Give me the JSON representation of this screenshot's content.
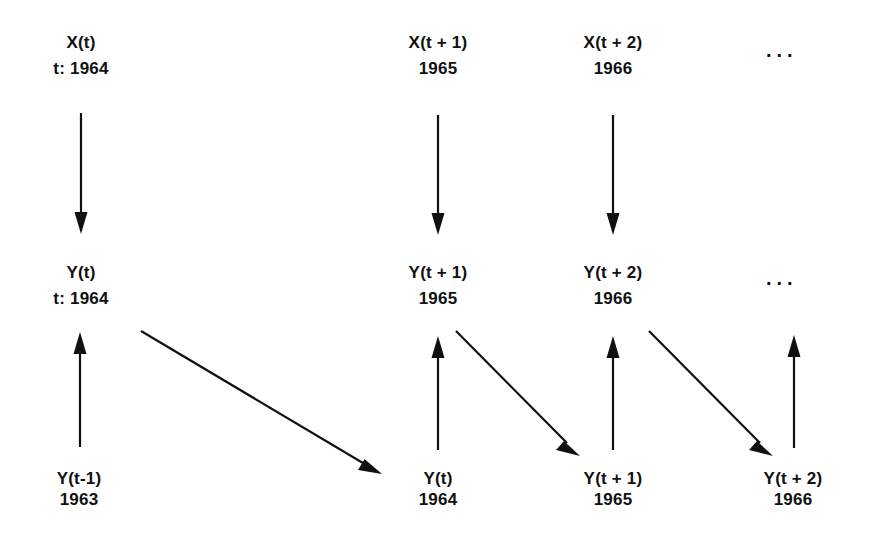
{
  "diagram": {
    "background_color": "#ffffff",
    "ink_color": "#101010",
    "rows": {
      "x_row": {
        "nodes": [
          {
            "symbol": "X(t)",
            "year": "t: 1964",
            "cx": 81,
            "y": 34
          },
          {
            "symbol": "X(t + 1)",
            "year": "1965",
            "cx": 438,
            "y": 34
          },
          {
            "symbol": "X(t + 2)",
            "year": "1966",
            "cx": 613,
            "y": 34
          }
        ],
        "ellipsis": {
          "text": "...",
          "x": 766,
          "y": 40
        }
      },
      "y_row": {
        "nodes": [
          {
            "symbol": "Y(t)",
            "year": "t: 1964",
            "cx": 81,
            "y": 264
          },
          {
            "symbol": "Y(t + 1)",
            "year": "1965",
            "cx": 438,
            "y": 264
          },
          {
            "symbol": "Y(t + 2)",
            "year": "1966",
            "cx": 613,
            "y": 264
          }
        ],
        "ellipsis": {
          "text": "...",
          "x": 766,
          "y": 268
        }
      },
      "y_lag_row": {
        "nodes": [
          {
            "symbol": "Y(t-1)",
            "year": "1963",
            "cx": 79,
            "y": 470
          },
          {
            "symbol": "Y(t)",
            "year": "1964",
            "cx": 438,
            "y": 470
          },
          {
            "symbol": "Y(t + 1)",
            "year": "1965",
            "cx": 613,
            "y": 470
          },
          {
            "symbol": "Y(t + 2)",
            "year": "1966",
            "cx": 793,
            "y": 470
          }
        ]
      }
    },
    "arrows": [
      {
        "name": "arrow-x-t-to-y-t",
        "kind": "vertical-down",
        "x1": 81,
        "y1": 113,
        "x2": 81,
        "y2": 232
      },
      {
        "name": "arrow-x-t1-to-y-t1",
        "kind": "vertical-down",
        "x1": 438,
        "y1": 115,
        "x2": 438,
        "y2": 233
      },
      {
        "name": "arrow-x-t2-to-y-t2",
        "kind": "vertical-down",
        "x1": 613,
        "y1": 115,
        "x2": 613,
        "y2": 233
      },
      {
        "name": "arrow-ylag-tm1-to-y-t",
        "kind": "vertical-up",
        "x1": 80,
        "y1": 447,
        "x2": 80,
        "y2": 333
      },
      {
        "name": "arrow-ylag-t-to-y-t1",
        "kind": "vertical-up",
        "x1": 438,
        "y1": 450,
        "x2": 438,
        "y2": 337
      },
      {
        "name": "arrow-ylag-t1-to-y-t2",
        "kind": "vertical-up",
        "x1": 613,
        "y1": 450,
        "x2": 613,
        "y2": 337
      },
      {
        "name": "arrow-ylag-t2-to-next",
        "kind": "vertical-up",
        "x1": 794,
        "y1": 448,
        "x2": 794,
        "y2": 336
      },
      {
        "name": "arrow-diagonal-y-t-to-ylag-t",
        "kind": "diagonal",
        "x1": 141,
        "y1": 331,
        "x2": 382,
        "y2": 474
      },
      {
        "name": "arrow-diagonal-y-t1-to-ylag-t1",
        "kind": "diagonal",
        "x1": 456,
        "y1": 331,
        "x2": 580,
        "y2": 456
      },
      {
        "name": "arrow-diagonal-y-t2-to-ylag-t2",
        "kind": "diagonal",
        "x1": 649,
        "y1": 331,
        "x2": 773,
        "y2": 456
      }
    ]
  }
}
